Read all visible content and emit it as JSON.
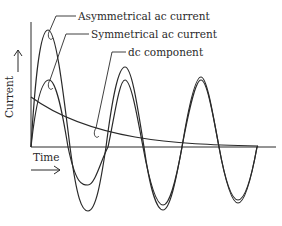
{
  "diagram": {
    "title": "",
    "labels": {
      "asymmetrical": "Asymmetrical ac current",
      "symmetrical": "Symmetrical ac current",
      "dc": "dc component",
      "y_axis": "Current",
      "x_axis": "Time"
    },
    "arrows": {
      "y_axis_arrow": "→",
      "x_axis_arrow": "→"
    },
    "colors": {
      "stroke": "#2a2a2a",
      "background": "#ffffff"
    },
    "series": [
      {
        "name": "Asymmetrical ac current",
        "description": "offset sinusoid, decaying offset toward symmetrical"
      },
      {
        "name": "Symmetrical ac current",
        "description": "sinusoid centered on time axis"
      },
      {
        "name": "dc component",
        "description": "exponentially decaying curve approaching time axis"
      }
    ]
  }
}
